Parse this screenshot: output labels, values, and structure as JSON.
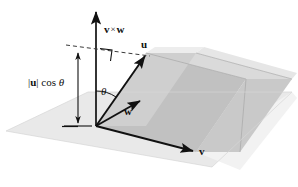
{
  "figure": {
    "labels": {
      "cross_product": "v × w",
      "cross_product_left": "v",
      "cross_product_times": "×",
      "cross_product_right": "w",
      "vector_u": "u",
      "vector_w": "w",
      "vector_v": "v",
      "angle_theta": "θ",
      "height_bar_open": "|",
      "height_u": "u",
      "height_bar_close": "|",
      "height_cos": "cos",
      "height_theta": "θ",
      "height_full": "|u| cos θ"
    },
    "colors": {
      "ground_plane": "#e8e8e8",
      "parallelepiped_top": "#d0d0d0",
      "parallelepiped_front": "#b9b9b9",
      "parallelepiped_side": "#c8c8c8",
      "shadow_plane": "#efefef",
      "stroke": "#111111",
      "dashed": "#2a2a2a",
      "background": "#ffffff"
    },
    "geometry": {
      "origin": [
        96,
        126
      ],
      "cross_arrow_tip": [
        96,
        9
      ],
      "u_tip": [
        146,
        53
      ],
      "w_tip": [
        143,
        103
      ],
      "v_tip": [
        196,
        152
      ],
      "measure_arrow_top": [
        78,
        50
      ],
      "measure_arrow_bottom": [
        78,
        127
      ],
      "right_angle_mark": [
        100,
        49
      ]
    }
  }
}
